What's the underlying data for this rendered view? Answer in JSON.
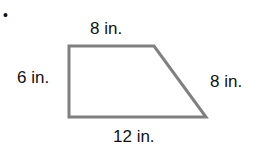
{
  "bullet": "•",
  "shape": {
    "type": "trapezoid",
    "stroke_color": "#808080",
    "vertices": [
      [
        69,
        46
      ],
      [
        154,
        46
      ],
      [
        206,
        117
      ],
      [
        69,
        117
      ]
    ]
  },
  "labels": {
    "top": "8 in.",
    "left": "6 in.",
    "right": "8 in.",
    "bottom": "12 in."
  }
}
